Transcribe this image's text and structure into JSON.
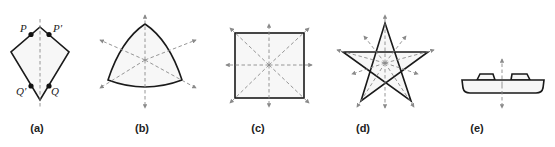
{
  "figure": {
    "panels": [
      {
        "id": "a",
        "label": "(a)",
        "shape": "kite",
        "points": [
          {
            "name": "P"
          },
          {
            "name": "P′"
          },
          {
            "name": "Q′"
          },
          {
            "name": "Q"
          }
        ]
      },
      {
        "id": "b",
        "label": "(b)",
        "shape": "curved-triangle"
      },
      {
        "id": "c",
        "label": "(c)",
        "shape": "square"
      },
      {
        "id": "d",
        "label": "(d)",
        "shape": "pentagram"
      },
      {
        "id": "e",
        "label": "(e)",
        "shape": "chip-with-pads"
      }
    ],
    "colors": {
      "stroke": "#1a1a1a",
      "axis": "#8a8a8a",
      "fill": "#f7f7f7"
    }
  }
}
